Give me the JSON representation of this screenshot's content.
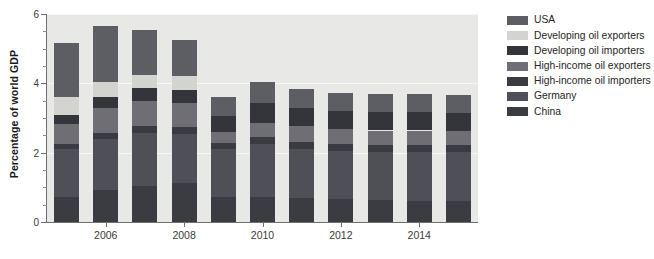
{
  "chart_data": {
    "type": "bar",
    "title": "",
    "subtitle": "",
    "xlabel": "",
    "ylabel": "Percentage of world GDP",
    "stacked": true,
    "orientation": "vertical",
    "grid": true,
    "legend_position": "right",
    "ylim": [
      0,
      6
    ],
    "ytick_labels": [
      "0",
      "2",
      "4",
      "6"
    ],
    "ytick_values": [
      0,
      2,
      4,
      6
    ],
    "yminor_step": 0.5,
    "categories": [
      "2005",
      "2006",
      "2007",
      "2008",
      "2009",
      "2010",
      "2011",
      "2012",
      "2013",
      "2014",
      "2015"
    ],
    "xtick_labels": [
      "2006",
      "2008",
      "2010",
      "2012",
      "2014"
    ],
    "xtick_categories": [
      "2006",
      "2008",
      "2010",
      "2012",
      "2014"
    ],
    "series": [
      {
        "name": "China",
        "color": "#3b3b42",
        "values": [
          0.72,
          0.92,
          1.05,
          1.12,
          0.72,
          0.72,
          0.68,
          0.66,
          0.64,
          0.62,
          0.62
        ]
      },
      {
        "name": "Germany",
        "color": "#4f4f58",
        "values": [
          1.38,
          1.48,
          1.52,
          1.42,
          1.38,
          1.52,
          1.42,
          1.4,
          1.38,
          1.4,
          1.4
        ]
      },
      {
        "name": "High-income oil importers",
        "color": "#3a3a41",
        "values": [
          0.16,
          0.18,
          0.2,
          0.2,
          0.18,
          0.22,
          0.22,
          0.2,
          0.2,
          0.2,
          0.2
        ]
      },
      {
        "name": "High-income oil exporters",
        "color": "#6e6e74",
        "values": [
          0.56,
          0.7,
          0.72,
          0.68,
          0.32,
          0.4,
          0.44,
          0.42,
          0.42,
          0.42,
          0.4
        ]
      },
      {
        "name": "Developing oil importers",
        "color": "#34343b",
        "values": [
          0.28,
          0.34,
          0.38,
          0.4,
          0.46,
          0.56,
          0.52,
          0.52,
          0.52,
          0.52,
          0.52
        ]
      },
      {
        "name": "Developing oil exporters",
        "color": "#d3d3d0",
        "values": [
          0.52,
          0.42,
          0.36,
          0.4,
          0.0,
          0.0,
          0.0,
          0.0,
          0.0,
          0.0,
          0.0
        ]
      },
      {
        "name": "USA",
        "color": "#5d5d64",
        "values": [
          1.54,
          1.62,
          1.32,
          1.04,
          0.56,
          0.62,
          0.56,
          0.52,
          0.52,
          0.52,
          0.52
        ]
      }
    ],
    "totals": [
      5.16,
      5.66,
      5.55,
      5.26,
      3.62,
      4.04,
      3.84,
      3.72,
      3.68,
      3.68,
      3.66
    ]
  },
  "legend": {
    "items": [
      {
        "label": "USA",
        "color": "#5d5d64"
      },
      {
        "label": "Developing oil exporters",
        "color": "#d3d3d0"
      },
      {
        "label": "Developing oil importers",
        "color": "#34343b"
      },
      {
        "label": "High-income oil exporters",
        "color": "#6e6e74"
      },
      {
        "label": "High-income oil importers",
        "color": "#3a3a41"
      },
      {
        "label": "Germany",
        "color": "#4f4f58"
      },
      {
        "label": "China",
        "color": "#3b3b42"
      }
    ]
  },
  "axes": {
    "y_title": "Percentage of world GDP"
  },
  "style": {
    "plot_background": "#e8e8e6",
    "page_background": "#ffffff",
    "axis_color": "#6f6f6f",
    "gridline_color": "#f7f7f5"
  }
}
